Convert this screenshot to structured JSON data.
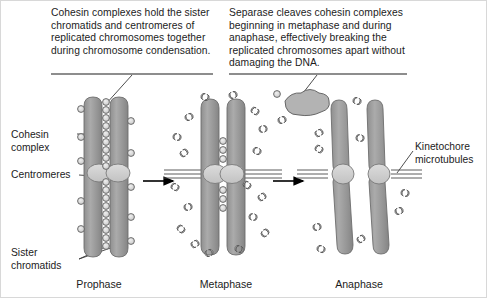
{
  "figure": {
    "background": "#ffffff",
    "border_color": "#d8d8d8"
  },
  "captions": [
    {
      "id": "cohesin-caption",
      "text": "Cohesin complexes hold the sister chromatids and centromeres of replicated chromosomes together during chromosome condensation.",
      "rule_color": "#8d8d8d"
    },
    {
      "id": "separase-caption",
      "text": "Separase cleaves cohesin complexes beginning in metaphase and during anaphase, effectively breaking the replicated chromosomes apart without damaging the DNA.",
      "rule_color": "#8d8d8d"
    }
  ],
  "labels": [
    {
      "id": "cohesin-complex",
      "text": "Cohesin complex"
    },
    {
      "id": "centromeres",
      "text": "Centromeres"
    },
    {
      "id": "sister-chromatids",
      "text": "Sister chromatids"
    },
    {
      "id": "kinetochore-microtubules",
      "text": "Kinetochore microtubules"
    }
  ],
  "phases": [
    {
      "id": "prophase",
      "label": "Prophase"
    },
    {
      "id": "metaphase",
      "label": "Metaphase"
    },
    {
      "id": "anaphase",
      "label": "Anaphase"
    }
  ],
  "colors": {
    "chromatid_fill": "#9a9a9a",
    "chromatid_edge": "#6d6d6d",
    "centromere_fill": "#cfcfcf",
    "centromere_edge": "#7a7a7a",
    "cohesin_ring_fill": "#d6d6d6",
    "cohesin_ring_edge": "#5e5e5e",
    "separase_fill": "#b3b3b3",
    "separase_edge": "#5a5a5a",
    "microtubule": "#4a4a4a",
    "arrow": "#000000",
    "leader": "#3a3a3a",
    "text": "#1c1c1c"
  },
  "icons": {
    "arrow": "phase-arrow-icon",
    "cohesin_ring": "cohesin-ring-icon",
    "cleaved_ring": "cleaved-cohesin-ring-icon",
    "separase": "separase-enzyme-icon",
    "microtubule": "microtubule-icon"
  }
}
